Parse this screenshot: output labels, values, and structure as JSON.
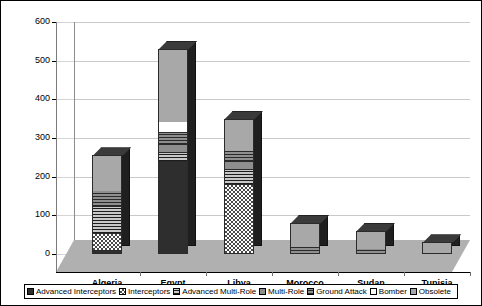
{
  "chart_data": {
    "type": "bar",
    "subtype": "stacked-column-3d",
    "title": "",
    "xlabel": "",
    "ylabel": "",
    "ylim": [
      0,
      600
    ],
    "ytick_step": 100,
    "yticks": [
      0,
      100,
      200,
      300,
      400,
      500,
      600
    ],
    "grid": true,
    "legend_position": "bottom",
    "categories": [
      "Algeria",
      "Egypt",
      "Libya",
      "Morocco",
      "Sudan",
      "Tunisia"
    ],
    "series": [
      {
        "name": "Advanced Interceptors",
        "pattern": "solid-black",
        "values": [
          10,
          240,
          0,
          0,
          0,
          0
        ]
      },
      {
        "name": "Interceptors",
        "pattern": "checker",
        "values": [
          45,
          0,
          180,
          0,
          0,
          0
        ]
      },
      {
        "name": "Advanced Multi-Role",
        "pattern": "horiz-stripe",
        "values": [
          70,
          25,
          40,
          0,
          0,
          0
        ]
      },
      {
        "name": "Multi-Role",
        "pattern": "solid-grey",
        "values": [
          0,
          20,
          20,
          0,
          0,
          0
        ]
      },
      {
        "name": "Ground Attack",
        "pattern": "dense-stripe",
        "values": [
          40,
          30,
          30,
          20,
          15,
          0
        ]
      },
      {
        "name": "Bomber",
        "pattern": "white",
        "values": [
          0,
          30,
          0,
          0,
          0,
          0
        ]
      },
      {
        "name": "Obsolete",
        "pattern": "light-grey",
        "values": [
          90,
          185,
          80,
          60,
          45,
          30
        ]
      }
    ],
    "totals": [
      255,
      530,
      350,
      80,
      60,
      30
    ]
  },
  "axis": {
    "y_labels": [
      "600",
      "500",
      "400",
      "300",
      "200",
      "100",
      "0"
    ],
    "x_labels": [
      "Algeria",
      "Egypt",
      "Libya",
      "Morocco",
      "Sudan",
      "Tunisia"
    ]
  },
  "legend": {
    "items": [
      {
        "label": "Advanced Interceptors",
        "swatch": "pat-adv-interceptors"
      },
      {
        "label": "Interceptors",
        "swatch": "pat-interceptors"
      },
      {
        "label": "Advanced Multi-Role",
        "swatch": "pat-adv-multirole"
      },
      {
        "label": "Multi-Role",
        "swatch": "pat-multirole"
      },
      {
        "label": "Ground Attack",
        "swatch": "pat-ground-attack"
      },
      {
        "label": "Bomber",
        "swatch": "pat-bomber"
      },
      {
        "label": "Obsolete",
        "swatch": "pat-obsolete"
      }
    ]
  },
  "colors": {
    "background": "#ffffff",
    "floor": "#b0b0b0",
    "gridline": "#c9c9c9",
    "axis": "#000000",
    "bar_outline": "#2b2b2b"
  }
}
